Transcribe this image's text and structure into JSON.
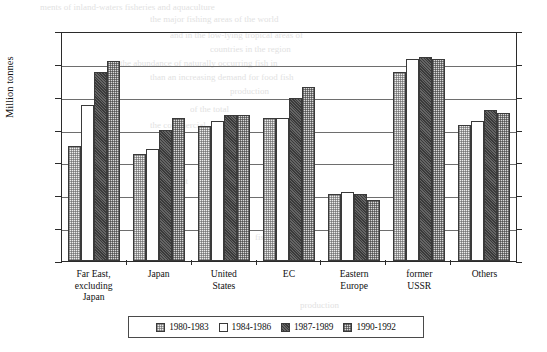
{
  "chart_data": {
    "type": "bar",
    "title": "",
    "xlabel": "",
    "ylabel": "Million tonnes",
    "ylim": [
      0,
      140
    ],
    "ytick_step": 20,
    "yticks": [
      0,
      20,
      40,
      60,
      80,
      100,
      120,
      140
    ],
    "grid": true,
    "legend_position": "bottom",
    "categories": [
      "Far East,\nexcluding\nJapan",
      "Japan",
      "United\nStates",
      "EC",
      "Eastern\nEurope",
      "former\nUSSR",
      "Others"
    ],
    "series": [
      {
        "name": "1980-1983",
        "pattern": "light-stipple",
        "color": "#ededed",
        "values": [
          70,
          65,
          82,
          87,
          41,
          115,
          83
        ]
      },
      {
        "name": "1984-1986",
        "pattern": "blank-white",
        "color": "#ffffff",
        "values": [
          95,
          68,
          85,
          87,
          42,
          123,
          85
        ]
      },
      {
        "name": "1987-1989",
        "pattern": "dark-hatch",
        "color": "#3a3a3a",
        "values": [
          115,
          80,
          89,
          99,
          41,
          124,
          92
        ]
      },
      {
        "name": "1990-1992",
        "pattern": "medium-stipple",
        "color": "#d9d9d9",
        "values": [
          122,
          87,
          89,
          106,
          37,
          123,
          90
        ]
      }
    ]
  },
  "legend": {
    "items": [
      {
        "label": "1980-1983"
      },
      {
        "label": "1984-1986"
      },
      {
        "label": "1987-1989"
      },
      {
        "label": "1990-1992"
      }
    ]
  },
  "axis": {
    "y_label": "Million tonnes",
    "y_ticks": [
      "140",
      "120",
      "100",
      "80",
      "60",
      "40",
      "20",
      "0"
    ]
  },
  "background_bleed": [
    {
      "text": "ments of inland-waters fisheries and aquaculture",
      "x": 40,
      "y": 2,
      "size": 9
    },
    {
      "text": "the major fishing areas of the world",
      "x": 150,
      "y": 14,
      "size": 9
    },
    {
      "text": "and in the low-lying tropical areas of",
      "x": 170,
      "y": 30,
      "size": 9
    },
    {
      "text": "countries in the region",
      "x": 210,
      "y": 44,
      "size": 9
    },
    {
      "text": "the abundance of naturally occurring fish in",
      "x": 120,
      "y": 58,
      "size": 9
    },
    {
      "text": "than an increasing demand for food fish",
      "x": 150,
      "y": 72,
      "size": 9
    },
    {
      "text": "production",
      "x": 230,
      "y": 86,
      "size": 9
    },
    {
      "text": "of the total",
      "x": 190,
      "y": 104,
      "size": 9
    },
    {
      "text": "the commercial",
      "x": 150,
      "y": 120,
      "size": 9
    },
    {
      "text": "is that",
      "x": 220,
      "y": 148,
      "size": 9
    },
    {
      "text": "significant",
      "x": 150,
      "y": 176,
      "size": 9
    },
    {
      "text": "in the decade",
      "x": 200,
      "y": 206,
      "size": 9
    },
    {
      "text": "fisheries",
      "x": 255,
      "y": 232,
      "size": 9
    },
    {
      "text": "production",
      "x": 300,
      "y": 300,
      "size": 9
    }
  ]
}
